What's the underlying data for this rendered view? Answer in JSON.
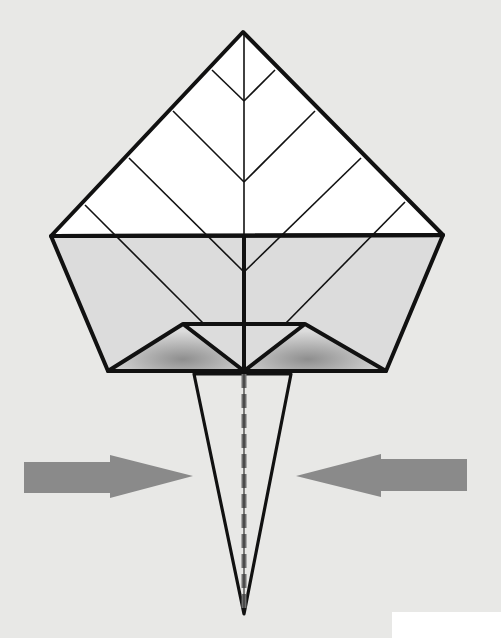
{
  "diagram": {
    "type": "origami-fold-step",
    "description_visible_text": [],
    "colors": {
      "background": "#e8e8e6",
      "paper_white": "#ffffff",
      "paper_gray": "#dcdcdc",
      "shadow": "#8e8e8e",
      "line": "#111111",
      "arrow": "#8a8a8a",
      "valley_fold": "#6f6f6f"
    },
    "shapes": {
      "top_triangle": "243,32 443,235 51,236",
      "gray_band": "51,236 443,235 386,371 108,371",
      "left_flap": "108,371 183,324 244,371",
      "right_flap": "244,371 305,324 386,371",
      "flap_top_bar": "183,324 305,324",
      "spike": "194,374 291,374 244,614"
    },
    "creases": [
      {
        "name": "crease-v1-left",
        "pts": "212,70 244,101"
      },
      {
        "name": "crease-v1-right",
        "pts": "275,70 244,101"
      },
      {
        "name": "crease-v2-left",
        "pts": "173,111 244,182"
      },
      {
        "name": "crease-v2-right",
        "pts": "315,111 244,182"
      },
      {
        "name": "crease-v3-left",
        "pts": "129,158 244,272"
      },
      {
        "name": "crease-v3-right",
        "pts": "361,158 244,272"
      },
      {
        "name": "crease-v4-left",
        "pts": "85,205 203,323"
      },
      {
        "name": "crease-v4-right",
        "pts": "405,202 286,323"
      }
    ],
    "arrows": [
      {
        "name": "push-right-arrow",
        "direction": "right",
        "pts": "24,462 110,462 110,455 193,476 110,498 110,493 24,493"
      },
      {
        "name": "push-left-arrow",
        "direction": "left",
        "pts": "467,459 381,459 381,454 296,476 381,497 381,491 467,491"
      }
    ]
  }
}
